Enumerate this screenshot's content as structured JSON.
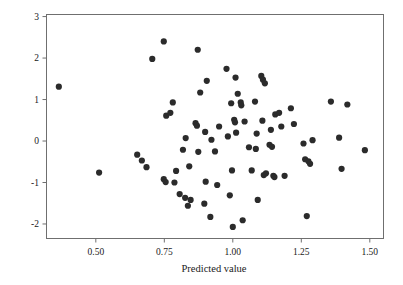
{
  "chart_data": {
    "type": "scatter",
    "title": "",
    "xlabel": "Predicted value",
    "ylabel": "",
    "xlim": [
      0.32,
      1.55
    ],
    "ylim": [
      -2.35,
      3.05
    ],
    "xticks": [
      0.5,
      0.75,
      1.0,
      1.25,
      1.5
    ],
    "xtick_labels": [
      "0.50",
      "0.75",
      "1.00",
      "1.25",
      "1.50"
    ],
    "yticks": [
      3,
      2,
      1,
      0,
      -1,
      -2
    ],
    "ytick_labels": [
      "3",
      "2",
      "1",
      "0",
      "-1",
      "-2"
    ],
    "grid": false,
    "legend": null,
    "marker": "filled-circle",
    "marker_color": "#2b2b2b",
    "marker_size": 3.1,
    "n_points": 92,
    "points": [
      [
        0.365,
        1.31
      ],
      [
        0.512,
        -0.76
      ],
      [
        0.651,
        -0.33
      ],
      [
        0.668,
        -0.47
      ],
      [
        0.685,
        -0.63
      ],
      [
        0.706,
        1.98
      ],
      [
        0.748,
        2.4
      ],
      [
        0.748,
        -0.92
      ],
      [
        0.755,
        -0.99
      ],
      [
        0.757,
        0.61
      ],
      [
        0.772,
        0.68
      ],
      [
        0.781,
        0.93
      ],
      [
        0.787,
        -1.0
      ],
      [
        0.793,
        -0.72
      ],
      [
        0.806,
        -1.28
      ],
      [
        0.818,
        -0.21
      ],
      [
        0.826,
        -1.37
      ],
      [
        0.828,
        0.07
      ],
      [
        0.836,
        -1.56
      ],
      [
        0.841,
        -0.61
      ],
      [
        0.846,
        -1.42
      ],
      [
        0.864,
        0.43
      ],
      [
        0.869,
        0.37
      ],
      [
        0.872,
        2.2
      ],
      [
        0.874,
        -0.26
      ],
      [
        0.881,
        1.17
      ],
      [
        0.896,
        -1.51
      ],
      [
        0.899,
        0.22
      ],
      [
        0.901,
        -0.98
      ],
      [
        0.905,
        1.45
      ],
      [
        0.918,
        -1.83
      ],
      [
        0.922,
        0.03
      ],
      [
        0.935,
        -0.25
      ],
      [
        0.943,
        -1.06
      ],
      [
        0.95,
        0.35
      ],
      [
        0.977,
        1.74
      ],
      [
        0.982,
        0.11
      ],
      [
        0.989,
        -1.31
      ],
      [
        0.994,
        0.91
      ],
      [
        0.997,
        -0.71
      ],
      [
        1.0,
        -2.07
      ],
      [
        1.005,
        0.51
      ],
      [
        1.008,
        0.45
      ],
      [
        1.01,
        1.53
      ],
      [
        1.012,
        0.2
      ],
      [
        1.018,
        1.14
      ],
      [
        1.029,
        0.93
      ],
      [
        1.031,
        0.86
      ],
      [
        1.036,
        -1.91
      ],
      [
        1.043,
        0.47
      ],
      [
        1.059,
        -0.15
      ],
      [
        1.069,
        -0.71
      ],
      [
        1.081,
        0.95
      ],
      [
        1.084,
        -0.19
      ],
      [
        1.087,
        0.18
      ],
      [
        1.091,
        -1.42
      ],
      [
        1.104,
        1.57
      ],
      [
        1.108,
        0.49
      ],
      [
        1.11,
        1.48
      ],
      [
        1.113,
        -0.82
      ],
      [
        1.117,
        1.39
      ],
      [
        1.121,
        -0.78
      ],
      [
        1.134,
        -0.09
      ],
      [
        1.139,
        0.27
      ],
      [
        1.143,
        -0.14
      ],
      [
        1.148,
        -0.84
      ],
      [
        1.152,
        -0.87
      ],
      [
        1.155,
        0.64
      ],
      [
        1.169,
        0.68
      ],
      [
        1.177,
        0.35
      ],
      [
        1.189,
        -0.84
      ],
      [
        1.212,
        0.79
      ],
      [
        1.223,
        0.41
      ],
      [
        1.258,
        -0.06
      ],
      [
        1.264,
        -0.44
      ],
      [
        1.27,
        -1.81
      ],
      [
        1.276,
        -0.49
      ],
      [
        1.282,
        -0.55
      ],
      [
        1.291,
        0.02
      ],
      [
        1.358,
        0.95
      ],
      [
        1.388,
        0.08
      ],
      [
        1.397,
        -0.67
      ],
      [
        1.418,
        0.88
      ],
      [
        1.482,
        -0.22
      ]
    ]
  },
  "axes": {
    "x_title": "Predicted value"
  }
}
